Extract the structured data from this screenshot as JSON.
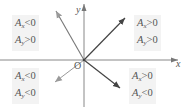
{
  "diagram": {
    "axes": {
      "x_label": "x",
      "y_label": "y",
      "origin_label": "O"
    },
    "quadrants": {
      "top_left": {
        "line1": {
          "sym": "A",
          "sub": "x",
          "rel": "<0"
        },
        "line2": {
          "sym": "A",
          "sub": "y",
          "rel": ">0"
        }
      },
      "top_right": {
        "line1": {
          "sym": "A",
          "sub": "x",
          "rel": ">0"
        },
        "line2": {
          "sym": "A",
          "sub": "y",
          "rel": ">0"
        }
      },
      "bottom_left": {
        "line1": {
          "sym": "A",
          "sub": "x",
          "rel": "<0"
        },
        "line2": {
          "sym": "A",
          "sub": "y",
          "rel": "<0"
        }
      },
      "bottom_right": {
        "line1": {
          "sym": "A",
          "sub": "x",
          "rel": ">0"
        },
        "line2": {
          "sym": "A",
          "sub": "y",
          "rel": "<0"
        }
      }
    },
    "vectors": [
      {
        "name": "vector-ne",
        "quadrant": "I"
      },
      {
        "name": "vector-nw",
        "quadrant": "II"
      },
      {
        "name": "vector-sw",
        "quadrant": "III"
      },
      {
        "name": "vector-se",
        "quadrant": "IV"
      }
    ],
    "colors": {
      "axis": "#888888",
      "vector_dark": "#444444",
      "vector_light": "#9a9a9a",
      "box_bg": "#f3f3f3"
    }
  }
}
